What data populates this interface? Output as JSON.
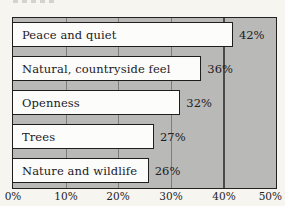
{
  "chart_data": {
    "type": "bar",
    "orientation": "horizontal",
    "title": "",
    "categories": [
      "Peace and quiet",
      "Natural, countryside feel",
      "Openness",
      "Trees",
      "Nature and wildlife"
    ],
    "values": [
      42,
      36,
      32,
      27,
      26
    ],
    "value_labels": [
      "42%",
      "36%",
      "32%",
      "27%",
      "26%"
    ],
    "x_ticks": [
      "0%",
      "10%",
      "20%",
      "30%",
      "40%",
      "50%"
    ],
    "xlim": [
      0,
      50
    ],
    "grid": true,
    "gridline_step_pct": 10,
    "legend": "none",
    "colors": {
      "page_bg": "#f6f5f0",
      "plot_bg": "#b9b9b7",
      "bar_fill": "#fcfcfb",
      "bar_border": "#1f1e1d",
      "gridline": "#7d7d7a",
      "gridline_dark": "#4c4c4a",
      "text": "#1c1c1c"
    }
  }
}
